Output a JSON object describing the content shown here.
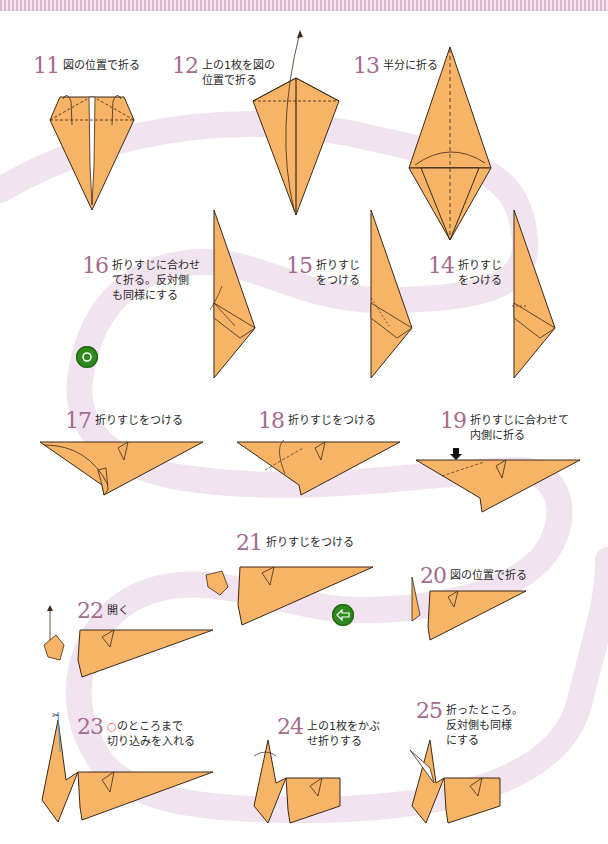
{
  "page": {
    "header_stripe_colors": [
      "#d9b6cf",
      "#f3e4ee"
    ],
    "path_color": "#f1e3ef",
    "paper_color": "#f7b366",
    "paper_edge_color": "#3a2a1a",
    "step_number_color": "#a56b8e",
    "icon_green": "#2f8a1e"
  },
  "steps": [
    {
      "num": "11",
      "text": "図の位置で折る"
    },
    {
      "num": "12",
      "text": "上の1枚を図の\n位置で折る"
    },
    {
      "num": "13",
      "text": "半分に折る"
    },
    {
      "num": "14",
      "text": "折りすじ\nをつける"
    },
    {
      "num": "15",
      "text": "折りすじ\nをつける"
    },
    {
      "num": "16",
      "text": "折りすじに合わせ\nて折る。反対側\nも同様にする"
    },
    {
      "num": "17",
      "text": "折りすじをつける"
    },
    {
      "num": "18",
      "text": "折りすじをつける"
    },
    {
      "num": "19",
      "text": "折りすじに合わせて\n内側に折る"
    },
    {
      "num": "20",
      "text": "図の位置で折る"
    },
    {
      "num": "21",
      "text": "折りすじをつける"
    },
    {
      "num": "22",
      "text": "開く"
    },
    {
      "num": "23",
      "ring": "○",
      "text": "のところまで\n切り込みを入れる"
    },
    {
      "num": "24",
      "text": "上の1枚をかぶ\nせ折りする"
    },
    {
      "num": "25",
      "text": "折ったところ。\n反対側も同様\nにする"
    }
  ],
  "icons": {
    "turn_over": "turn-over-icon",
    "flip_direction": "flip-arrow-icon"
  }
}
